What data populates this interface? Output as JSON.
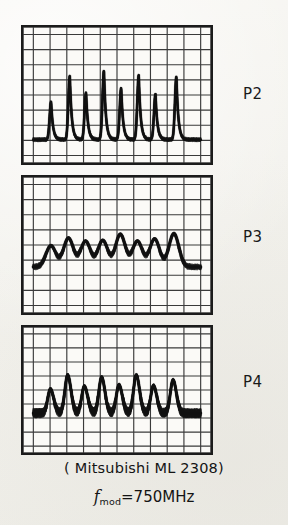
{
  "figure": {
    "background_color": "#f2f1ec",
    "trace_color": "#101010",
    "grid_color": "#3a3a3a",
    "border_color": "#1b1b1b",
    "caption_device": "( Mitsubishi  ML 2308)",
    "caption_freq_symbol": "f",
    "caption_freq_subscript": "mod",
    "caption_freq_value": "=750MHz"
  },
  "panels": [
    {
      "id": "p2",
      "label": "P2",
      "x": 21,
      "y": 25,
      "w": 192,
      "h": 140,
      "grid": {
        "cols": 10,
        "rows": 8
      }
    },
    {
      "id": "p3",
      "label": "P3",
      "x": 21,
      "y": 175,
      "w": 192,
      "h": 140,
      "grid": {
        "cols": 10,
        "rows": 8
      }
    },
    {
      "id": "p4",
      "label": "P4",
      "x": 21,
      "y": 325,
      "w": 192,
      "h": 130,
      "grid": {
        "cols": 10,
        "rows": 8
      }
    }
  ],
  "chart_data": {
    "type": "line",
    "xlabel": "time (oscilloscope sweep)",
    "ylabel": "optical pulse intensity",
    "grid": true,
    "legend": "right",
    "axis_ticks_labeled": false,
    "xlim": [
      0,
      10
    ],
    "ylim": [
      0,
      8
    ],
    "series": [
      {
        "name": "P2",
        "description": "narrow high-contrast spikes with near-zero baseline",
        "baseline": 1.05,
        "pulse_centers": [
          1.06,
          2.18,
          3.15,
          4.22,
          5.25,
          6.3,
          7.3,
          8.55
        ],
        "pulse_peaks": [
          3.55,
          5.25,
          4.15,
          5.6,
          4.45,
          5.3,
          4.05,
          5.2
        ],
        "pulse_width": 0.3
      },
      {
        "name": "P3",
        "description": "broad rounded pulses riding on a raised baseline",
        "baseline": 2.55,
        "pulse_centers": [
          1.05,
          2.1,
          3.12,
          4.15,
          5.2,
          6.22,
          7.25,
          8.4
        ],
        "pulse_peaks": [
          3.95,
          4.45,
          4.25,
          4.3,
          4.7,
          4.25,
          4.4,
          4.75
        ],
        "pulse_width": 0.52
      },
      {
        "name": "P4",
        "description": "medium pulses with thick noisy pedestal between peaks",
        "baseline": 2.35,
        "pulse_centers": [
          1.02,
          2.05,
          3.05,
          4.08,
          5.12,
          6.15,
          7.18,
          8.35
        ],
        "pulse_peaks": [
          4.05,
          5.05,
          4.25,
          4.9,
          4.35,
          5.05,
          4.3,
          4.7
        ],
        "pulse_width": 0.4
      }
    ]
  }
}
